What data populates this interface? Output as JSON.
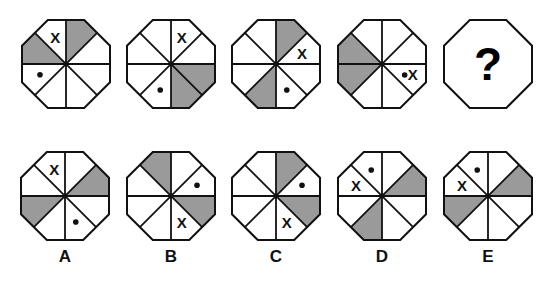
{
  "puzzle": {
    "colors": {
      "shade": "#9a9a9a",
      "stroke": "#111111",
      "background": "#ffffff"
    },
    "sector_order_note": "sectors 0-7 clockwise starting at 12 o'clock",
    "sequence": [
      {
        "id": "seq-1",
        "cx": 66,
        "cy": 64,
        "shaded": [
          0,
          6
        ],
        "x_sector": 7,
        "dot_sector": 5
      },
      {
        "id": "seq-2",
        "cx": 171,
        "cy": 64,
        "shaded": [
          2,
          3
        ],
        "x_sector": 0,
        "dot_sector": 4
      },
      {
        "id": "seq-3",
        "cx": 276,
        "cy": 64,
        "shaded": [
          0,
          4
        ],
        "x_sector": 1,
        "dot_sector": 3
      },
      {
        "id": "seq-4",
        "cx": 382,
        "cy": 64,
        "shaded": [
          5,
          6
        ],
        "x_sector": 2,
        "dot_sector": 2,
        "combined": true
      },
      {
        "id": "seq-5",
        "cx": 488,
        "cy": 64,
        "question": "?"
      }
    ],
    "options": [
      {
        "label": "A",
        "cx": 65,
        "cy": 196,
        "shaded": [
          1,
          5
        ],
        "x_sector": 7,
        "dot_sector": 3
      },
      {
        "label": "B",
        "cx": 171,
        "cy": 196,
        "shaded": [
          7,
          2
        ],
        "x_sector": 3,
        "dot_sector": 1
      },
      {
        "label": "C",
        "cx": 276,
        "cy": 196,
        "shaded": [
          0,
          2
        ],
        "x_sector": 3,
        "dot_sector": 1
      },
      {
        "label": "D",
        "cx": 382,
        "cy": 196,
        "shaded": [
          1,
          4
        ],
        "x_sector": 6,
        "dot_sector": 7
      },
      {
        "label": "E",
        "cx": 488,
        "cy": 196,
        "shaded": [
          1,
          5
        ],
        "x_sector": 6,
        "dot_sector": 7
      }
    ],
    "x_text": "X",
    "question_text": "?"
  }
}
